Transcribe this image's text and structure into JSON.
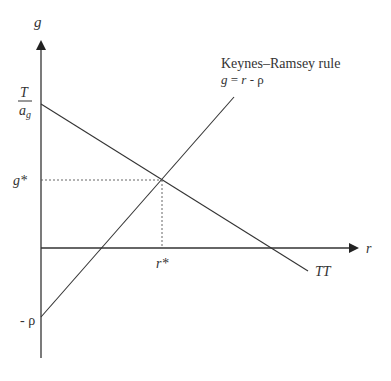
{
  "diagram": {
    "axes": {
      "y_label": "g",
      "x_label": "r"
    },
    "y_ticks": {
      "intercept_numerator": "T",
      "intercept_denominator_base": "a",
      "intercept_denominator_sub": "g",
      "g_star": "g*",
      "neg_rho": "- ρ"
    },
    "x_ticks": {
      "r_star": "r*"
    },
    "curves": {
      "kr_title": "Keynes–Ramsey rule",
      "kr_equation": "g = r - ρ",
      "tt_label": "TT"
    },
    "colors": {
      "line": "#333333",
      "dotted": "#555555"
    }
  }
}
